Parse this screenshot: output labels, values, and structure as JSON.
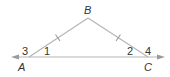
{
  "diagram": {
    "type": "geometry-triangle",
    "colors": {
      "line": "#b5b5b5",
      "text": "#333333",
      "background": "#ffffff"
    },
    "vertices": {
      "A": {
        "label": "A",
        "x": 29,
        "y": 57
      },
      "B": {
        "label": "B",
        "x": 88,
        "y": 18
      },
      "C": {
        "label": "C",
        "x": 148,
        "y": 57
      }
    },
    "angles": {
      "angle1": {
        "label": "1"
      },
      "angle2": {
        "label": "2"
      },
      "angle3": {
        "label": "3"
      },
      "angle4": {
        "label": "4"
      }
    },
    "line": {
      "description": "line through A and C with arrows on both ends"
    },
    "congruence_marks": {
      "AB": "single tick",
      "BC": "single tick"
    }
  }
}
